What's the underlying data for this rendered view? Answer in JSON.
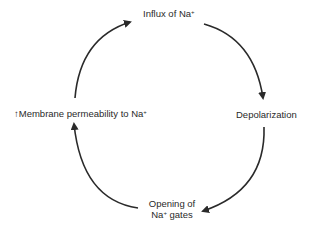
{
  "diagram": {
    "colors": {
      "stroke": "#2a2a2a",
      "text": "#2a2a2a",
      "background": "#ffffff"
    },
    "nodes": [
      {
        "id": "influx",
        "label": "Influx of Na",
        "sup": "+"
      },
      {
        "id": "depolarization",
        "label": "Depolarization"
      },
      {
        "id": "opening",
        "label_line1": "Opening of",
        "label_line2_prefix": "Na",
        "label_line2_sup": "+",
        "label_line2_suffix": " gates"
      },
      {
        "id": "permeability",
        "prefix_icon": "↑",
        "label": "Membrane permeability to Na",
        "sup": "+"
      }
    ],
    "edges": [
      {
        "from": "influx",
        "to": "depolarization"
      },
      {
        "from": "depolarization",
        "to": "opening"
      },
      {
        "from": "opening",
        "to": "permeability"
      },
      {
        "from": "permeability",
        "to": "influx"
      }
    ]
  }
}
